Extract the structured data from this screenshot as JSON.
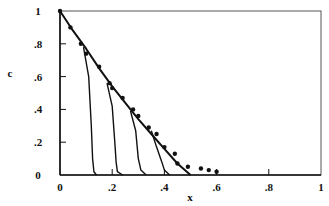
{
  "chart_data": {
    "type": "line",
    "title": "",
    "xlabel": "x",
    "ylabel": "c",
    "xlim": [
      0,
      1
    ],
    "ylim": [
      0,
      1
    ],
    "grid": false,
    "legend": null,
    "x_ticks": [
      {
        "value": 0,
        "label": "0"
      },
      {
        "value": 0.2,
        "label": ".2"
      },
      {
        "value": 0.4,
        "label": ".4"
      },
      {
        "value": 0.6,
        "label": ".6"
      },
      {
        "value": 0.8,
        "label": ".8"
      },
      {
        "value": 1,
        "label": "1"
      }
    ],
    "y_ticks": [
      {
        "value": 0,
        "label": "0"
      },
      {
        "value": 0.2,
        "label": ".2"
      },
      {
        "value": 0.4,
        "label": ".4"
      },
      {
        "value": 0.6,
        "label": ".6"
      },
      {
        "value": 0.8,
        "label": ".8"
      },
      {
        "value": 1,
        "label": "1"
      }
    ],
    "series": [
      {
        "name": "main-curve",
        "style": "line",
        "x": [
          0,
          0.05,
          0.1,
          0.15,
          0.2,
          0.25,
          0.3,
          0.35,
          0.4,
          0.45,
          0.5
        ],
        "y": [
          1,
          0.88,
          0.77,
          0.65,
          0.54,
          0.44,
          0.34,
          0.25,
          0.16,
          0.07,
          0.0
        ]
      },
      {
        "name": "measured-points",
        "style": "markers",
        "x": [
          0,
          0.04,
          0.08,
          0.1,
          0.15,
          0.19,
          0.2,
          0.24,
          0.28,
          0.3,
          0.34,
          0.37,
          0.4,
          0.44,
          0.45,
          0.49,
          0.54,
          0.57,
          0.6
        ],
        "y": [
          1,
          0.9,
          0.8,
          0.74,
          0.66,
          0.56,
          0.53,
          0.47,
          0.4,
          0.36,
          0.29,
          0.25,
          0.17,
          0.13,
          0.07,
          0.05,
          0.04,
          0.03,
          0.02
        ]
      },
      {
        "name": "drop-curve-1",
        "style": "line",
        "x": [
          0.09,
          0.11,
          0.12,
          0.125,
          0.13,
          0.14
        ],
        "y": [
          0.78,
          0.6,
          0.3,
          0.1,
          0.02,
          0.0
        ]
      },
      {
        "name": "drop-curve-2",
        "style": "line",
        "x": [
          0.18,
          0.2,
          0.21,
          0.215,
          0.22,
          0.24
        ],
        "y": [
          0.56,
          0.42,
          0.2,
          0.08,
          0.02,
          0.0
        ]
      },
      {
        "name": "drop-curve-3",
        "style": "line",
        "x": [
          0.27,
          0.29,
          0.3,
          0.31,
          0.33
        ],
        "y": [
          0.39,
          0.27,
          0.1,
          0.03,
          0.0
        ]
      },
      {
        "name": "drop-curve-4",
        "style": "line",
        "x": [
          0.35,
          0.37,
          0.39,
          0.4,
          0.42
        ],
        "y": [
          0.27,
          0.17,
          0.08,
          0.03,
          0.0
        ]
      }
    ]
  }
}
